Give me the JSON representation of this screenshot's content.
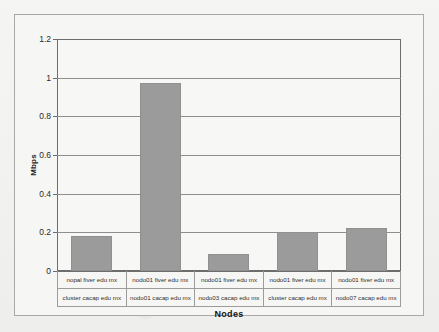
{
  "chart_data": {
    "type": "bar",
    "title": "",
    "xlabel": "Nodes",
    "ylabel": "Mbps",
    "ylim": [
      0,
      1.2
    ],
    "yticks": [
      "0",
      "0.2",
      "0.4",
      "0.6",
      "0.8",
      "1",
      "1.2"
    ],
    "ytick_values": [
      0,
      0.2,
      0.4,
      0.6,
      0.8,
      1,
      1.2
    ],
    "grid": true,
    "legend": "none",
    "categories": [
      "nopal.fiver.edu.mx / cluster.cacap.edu.mx",
      "nodo01.fiver.edu.mx / nodo01.cacap.edu.mx",
      "nodo01.fiver.edu.mx / nodo03.cacap.edu.mx",
      "nodo01.fiver.edu.mx / cluster.cacap.edu.mx",
      "nodo01.fiver.edu.mx / nodo07.cacap.edu.mx"
    ],
    "category_rows": [
      [
        "nopal fiver edu mx",
        "nodo01 fiver edu mx",
        "nodo01 fiver edu mx",
        "nodo01 fiver edu mx",
        "nodo01 fiver edu mx"
      ],
      [
        "cluster cacap edu mx",
        "nodo01 cacap edu mx",
        "nodo03 cacap edu mx",
        "cluster cacap edu mx",
        "nodo07 cacap edu mx"
      ]
    ],
    "values": [
      0.18,
      0.97,
      0.09,
      0.2,
      0.22
    ],
    "bar_color": "#9a9b9a",
    "plot_background": "#f7f7f5",
    "grid_color": "#8e8e8e",
    "axis_color": "#6d6d6d"
  }
}
